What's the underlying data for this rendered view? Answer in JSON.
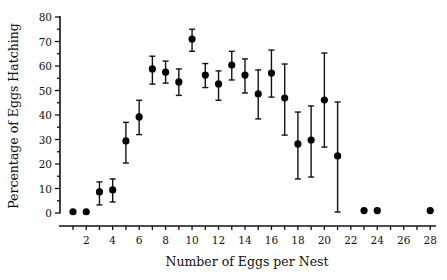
{
  "chart_data": {
    "type": "scatter",
    "title": "",
    "xlabel": "Number of Eggs per Nest",
    "ylabel": "Percentage of Eggs Hatching",
    "xlim": [
      0,
      28
    ],
    "ylim": [
      0,
      80
    ],
    "grid": false,
    "legend": "none",
    "x_ticks": [
      2,
      4,
      6,
      8,
      10,
      12,
      14,
      16,
      18,
      20,
      22,
      24,
      26,
      28
    ],
    "x_minor_ticks_step": 1,
    "y_ticks": [
      0,
      10,
      20,
      30,
      40,
      50,
      60,
      70,
      80
    ],
    "y_minor_ticks_step": 5,
    "series": [
      {
        "name": "Percentage of eggs hatching (mean ± error)",
        "points": [
          {
            "x": 1,
            "y": 0.5,
            "low": null,
            "high": null
          },
          {
            "x": 2,
            "y": 0.5,
            "low": null,
            "high": null
          },
          {
            "x": 3,
            "y": 8.6,
            "low": 3.3,
            "high": 12.7
          },
          {
            "x": 4,
            "y": 9.4,
            "low": 4.5,
            "high": 13.9
          },
          {
            "x": 5,
            "y": 29.4,
            "low": 20.4,
            "high": 37
          },
          {
            "x": 6,
            "y": 39.2,
            "low": 32,
            "high": 46
          },
          {
            "x": 7,
            "y": 58.8,
            "low": 52.6,
            "high": 64
          },
          {
            "x": 8,
            "y": 57.5,
            "low": 53,
            "high": 62
          },
          {
            "x": 9,
            "y": 53.5,
            "low": 48,
            "high": 58.8
          },
          {
            "x": 10,
            "y": 71,
            "low": 66,
            "high": 75
          },
          {
            "x": 11,
            "y": 56.3,
            "low": 51.2,
            "high": 61
          },
          {
            "x": 12,
            "y": 52.7,
            "low": 46,
            "high": 58
          },
          {
            "x": 13,
            "y": 60.4,
            "low": 54.3,
            "high": 66
          },
          {
            "x": 14,
            "y": 56.3,
            "low": 49,
            "high": 62.9
          },
          {
            "x": 15,
            "y": 48.6,
            "low": 38.4,
            "high": 58.4
          },
          {
            "x": 16,
            "y": 57.1,
            "low": 47.3,
            "high": 66.5
          },
          {
            "x": 17,
            "y": 46.9,
            "low": 31.8,
            "high": 60.8
          },
          {
            "x": 18,
            "y": 28.2,
            "low": 13.9,
            "high": 41.2
          },
          {
            "x": 19,
            "y": 29.8,
            "low": 14.7,
            "high": 43.7
          },
          {
            "x": 20,
            "y": 46.1,
            "low": 26.9,
            "high": 65.3
          },
          {
            "x": 21,
            "y": 23.3,
            "low": 0.4,
            "high": 45.3
          },
          {
            "x": 23,
            "y": 1,
            "low": null,
            "high": null
          },
          {
            "x": 24,
            "y": 1,
            "low": null,
            "high": null
          },
          {
            "x": 28,
            "y": 1,
            "low": null,
            "high": null
          }
        ]
      }
    ]
  }
}
